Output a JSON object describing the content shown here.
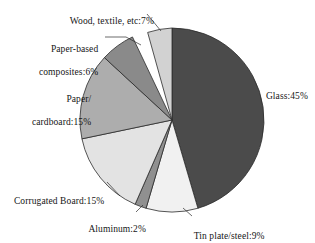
{
  "chart_data": {
    "type": "pie",
    "title": "",
    "subtitle": "",
    "xlabel": "",
    "ylabel": "",
    "legend_position": "labels-with-leader-lines",
    "grid": false,
    "units": "percent",
    "start_angle_deg": 0,
    "direction": "clockwise",
    "categories": [
      "Glass",
      "Tin plate/steel",
      "Aluminum",
      "Corrugated Board",
      "Paper/cardboard",
      "Paper-based composites",
      "Wood, textile, etc"
    ],
    "values": [
      45,
      9,
      2,
      15,
      15,
      6,
      7
    ],
    "slices": [
      {
        "name": "Glass",
        "value": 45,
        "label": "Glass:45%",
        "color": "#4b4b4b",
        "label_lines": [
          "Glass:45%"
        ]
      },
      {
        "name": "Tin plate/steel",
        "value": 9,
        "label": "Tin plate/steel:9%",
        "color": "#f1f1f1",
        "label_lines": [
          "Tin plate/steel:9%"
        ]
      },
      {
        "name": "Aluminum",
        "value": 2,
        "label": "Aluminum:2%",
        "color": "#909090",
        "label_lines": [
          "Aluminum:2%"
        ]
      },
      {
        "name": "Corrugated Board",
        "value": 15,
        "label": "Corrugated Board:15%",
        "color": "#e3e3e3",
        "label_lines": [
          "Corrugated Board:15%"
        ]
      },
      {
        "name": "Paper/cardboard",
        "value": 15,
        "label": "Paper/cardboard:15%",
        "color": "#adadad",
        "label_lines": [
          "Paper/",
          "cardboard:15%"
        ]
      },
      {
        "name": "Paper-based composites",
        "value": 6,
        "label": "Paper-based composites:6%",
        "color": "#8a8a8a",
        "label_lines": [
          "Paper-based",
          "composites:6%"
        ]
      },
      {
        "name": "Wood, textile, etc",
        "value": 7,
        "label": "Wood, textile, etc:7%",
        "color": "#d2d2d2",
        "label_lines": [
          "Wood, textile, etc:7%"
        ]
      }
    ],
    "colors": {
      "glass": "#4b4b4b",
      "tin_plate_steel": "#f1f1f1",
      "aluminum": "#909090",
      "corrugated_board": "#e3e3e3",
      "paper_cardboard": "#adadad",
      "paper_based_composites": "#8a8a8a",
      "wood_textile": "#d2d2d2",
      "outline": "#2b2b2b",
      "background": "#ffffff",
      "text": "#151515"
    }
  },
  "labels": {
    "glass": "Glass:45%",
    "tinplate": "Tin plate/steel:9%",
    "aluminum": "Aluminum:2%",
    "corrugated": "Corrugated Board:15%",
    "paper_line1": "Paper/",
    "paper_line2": "cardboard:15%",
    "composites_line1": "Paper-based",
    "composites_line2": "composites:6%",
    "wood": "Wood, textile, etc:7%"
  }
}
